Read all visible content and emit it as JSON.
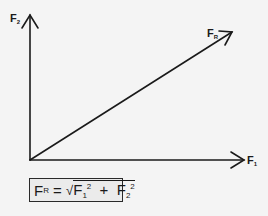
{
  "diagram": {
    "labels": {
      "y_axis": {
        "main": "F",
        "sub": "2"
      },
      "x_axis": {
        "main": "F",
        "sub": "1"
      },
      "resultant": {
        "main": "F",
        "sub": "R"
      }
    },
    "formula": {
      "lhs_main": "F",
      "lhs_sub": "R",
      "equals": " = ",
      "sqrt": "√",
      "term1_main": "F",
      "term1_sub": "1",
      "term1_sup": "2",
      "plus": " + ",
      "term2_main": "F",
      "term2_sub": "2",
      "term2_sup": "2"
    },
    "colors": {
      "stroke": "#1a1a1a",
      "background": "#f4f4f4",
      "formula_fill": "#ebebeb"
    }
  }
}
